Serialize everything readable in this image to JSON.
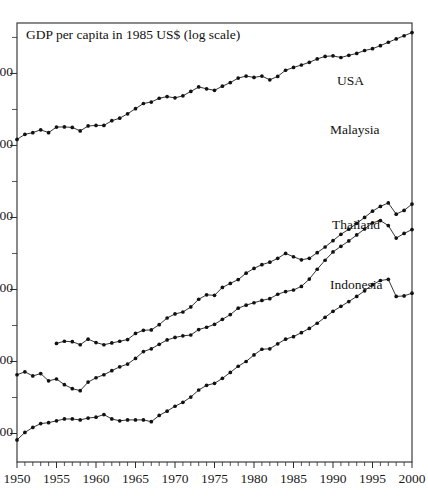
{
  "chart_data": {
    "type": "line",
    "title": "GDP per capita in 1985 US$ (log scale)",
    "xlabel": "",
    "ylabel": "",
    "scale": "log",
    "grid": false,
    "legend_position": "inline-right",
    "xlim": [
      1950,
      2000
    ],
    "ylim": [
      380,
      26000
    ],
    "xticks": [
      1950,
      1955,
      1960,
      1965,
      1970,
      1975,
      1980,
      1985,
      1990,
      1995,
      2000
    ],
    "xtick_labels": [
      "1950",
      "1955",
      "1960",
      "1965",
      "1970",
      "1975",
      "1980",
      "1985",
      "1990",
      "1995",
      "2000"
    ],
    "xminor_tick_step": 1,
    "yticks": [
      500,
      1000,
      2000,
      4000,
      8000,
      16000
    ],
    "ytick_labels": [
      "500",
      "1000",
      "2000",
      "4000",
      "8000",
      "16000"
    ],
    "marker": "filled-circle",
    "line_color": "#111111",
    "series": [
      {
        "name": "USA",
        "label": "USA",
        "x": [
          1950,
          1951,
          1952,
          1953,
          1954,
          1955,
          1956,
          1957,
          1958,
          1959,
          1960,
          1961,
          1962,
          1963,
          1964,
          1965,
          1966,
          1967,
          1968,
          1969,
          1970,
          1971,
          1972,
          1973,
          1974,
          1975,
          1976,
          1977,
          1978,
          1979,
          1980,
          1981,
          1982,
          1983,
          1984,
          1985,
          1986,
          1987,
          1988,
          1989,
          1990,
          1991,
          1992,
          1993,
          1994,
          1995,
          1996,
          1997,
          1998,
          1999,
          2000
        ],
        "values": [
          8480,
          8900,
          9050,
          9300,
          9050,
          9550,
          9560,
          9520,
          9200,
          9650,
          9700,
          9700,
          10150,
          10400,
          10850,
          11400,
          11980,
          12150,
          12600,
          12800,
          12650,
          12900,
          13450,
          14050,
          13800,
          13600,
          14150,
          14650,
          15300,
          15600,
          15400,
          15600,
          15050,
          15550,
          16500,
          16950,
          17350,
          17800,
          18400,
          18850,
          18950,
          18650,
          19050,
          19400,
          19950,
          20300,
          20900,
          21600,
          22300,
          23000,
          23700
        ]
      },
      {
        "name": "Malaysia",
        "label": "Malaysia",
        "x": [
          1955,
          1956,
          1957,
          1958,
          1959,
          1960,
          1961,
          1962,
          1963,
          1964,
          1965,
          1966,
          1967,
          1968,
          1969,
          1970,
          1971,
          1972,
          1973,
          1974,
          1975,
          1976,
          1977,
          1978,
          1979,
          1980,
          1981,
          1982,
          1983,
          1984,
          1985,
          1986,
          1987,
          1988,
          1989,
          1990,
          1991,
          1992,
          1993,
          1994,
          1995,
          1996,
          1997,
          1998,
          1999,
          2000
        ],
        "values": [
          1190,
          1215,
          1210,
          1175,
          1240,
          1200,
          1175,
          1195,
          1215,
          1235,
          1310,
          1350,
          1355,
          1425,
          1520,
          1580,
          1610,
          1690,
          1820,
          1900,
          1890,
          2040,
          2120,
          2200,
          2340,
          2450,
          2540,
          2600,
          2700,
          2830,
          2740,
          2660,
          2700,
          2850,
          3010,
          3200,
          3400,
          3570,
          3780,
          4000,
          4250,
          4450,
          4600,
          4130,
          4280,
          4550
        ]
      },
      {
        "name": "Thailand",
        "label": "Thailand",
        "x": [
          1950,
          1951,
          1952,
          1953,
          1954,
          1955,
          1956,
          1957,
          1958,
          1959,
          1960,
          1961,
          1962,
          1963,
          1964,
          1965,
          1966,
          1967,
          1968,
          1969,
          1970,
          1971,
          1972,
          1973,
          1974,
          1975,
          1976,
          1977,
          1978,
          1979,
          1980,
          1981,
          1982,
          1983,
          1984,
          1985,
          1986,
          1987,
          1988,
          1989,
          1990,
          1991,
          1992,
          1993,
          1994,
          1995,
          1996,
          1997,
          1998,
          1999,
          2000
        ],
        "values": [
          880,
          905,
          870,
          890,
          830,
          845,
          800,
          770,
          755,
          820,
          855,
          880,
          915,
          950,
          975,
          1030,
          1100,
          1130,
          1180,
          1230,
          1260,
          1280,
          1290,
          1360,
          1390,
          1430,
          1500,
          1570,
          1670,
          1720,
          1760,
          1800,
          1830,
          1910,
          1960,
          1990,
          2060,
          2210,
          2430,
          2650,
          2870,
          3030,
          3190,
          3380,
          3580,
          3800,
          3880,
          3700,
          3280,
          3430,
          3560
        ]
      },
      {
        "name": "Indonesia",
        "label": "Indonesia",
        "x": [
          1950,
          1951,
          1952,
          1953,
          1954,
          1955,
          1956,
          1957,
          1958,
          1959,
          1960,
          1961,
          1962,
          1963,
          1964,
          1965,
          1966,
          1967,
          1968,
          1969,
          1970,
          1971,
          1972,
          1973,
          1974,
          1975,
          1976,
          1977,
          1978,
          1979,
          1980,
          1981,
          1982,
          1983,
          1984,
          1985,
          1986,
          1987,
          1988,
          1989,
          1990,
          1991,
          1992,
          1993,
          1994,
          1995,
          1996,
          1997,
          1998,
          1999,
          2000
        ],
        "values": [
          470,
          505,
          530,
          550,
          555,
          565,
          575,
          575,
          570,
          580,
          585,
          600,
          575,
          565,
          570,
          570,
          570,
          560,
          595,
          620,
          650,
          675,
          710,
          760,
          795,
          810,
          850,
          900,
          955,
          1000,
          1065,
          1125,
          1130,
          1185,
          1240,
          1270,
          1320,
          1375,
          1445,
          1530,
          1620,
          1700,
          1780,
          1870,
          1975,
          2095,
          2180,
          2205,
          1870,
          1880,
          1930
        ]
      }
    ],
    "series_label_positions": [
      {
        "name": "USA",
        "x": 337,
        "y": 82
      },
      {
        "name": "Malaysia",
        "x": 330,
        "y": 131
      },
      {
        "name": "Thailand",
        "x": 332,
        "y": 226
      },
      {
        "name": "Indonesia",
        "x": 330,
        "y": 286
      }
    ]
  },
  "plot_box": {
    "left": 17,
    "top": 23,
    "right": 412,
    "bottom": 462
  }
}
